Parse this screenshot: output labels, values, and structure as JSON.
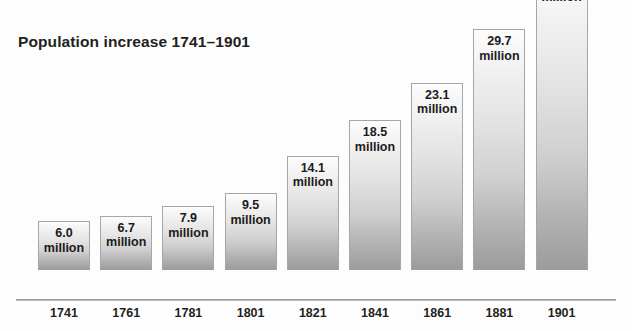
{
  "chart_data": {
    "type": "bar",
    "title": "Population increase 1741–1901",
    "xlabel": "",
    "ylabel": "",
    "unit_label": "million",
    "categories": [
      "1741",
      "1761",
      "1781",
      "1801",
      "1821",
      "1841",
      "1861",
      "1881",
      "1901"
    ],
    "values": [
      6.0,
      6.7,
      7.9,
      9.5,
      14.1,
      18.5,
      23.1,
      29.7,
      37.0
    ],
    "value_labels": [
      "6.0",
      "6.7",
      "7.9",
      "9.5",
      "14.1",
      "18.5",
      "23.1",
      "29.7",
      "37.0"
    ],
    "ylim": [
      0,
      37.0
    ],
    "grid": false,
    "legend": null,
    "bars": [
      {
        "year": "1741",
        "value": 6.0,
        "value_label": "6.0",
        "unit": "million"
      },
      {
        "year": "1761",
        "value": 6.7,
        "value_label": "6.7",
        "unit": "million"
      },
      {
        "year": "1781",
        "value": 7.9,
        "value_label": "7.9",
        "unit": "million"
      },
      {
        "year": "1801",
        "value": 9.5,
        "value_label": "9.5",
        "unit": "million"
      },
      {
        "year": "1821",
        "value": 14.1,
        "value_label": "14.1",
        "unit": "million"
      },
      {
        "year": "1841",
        "value": 18.5,
        "value_label": "18.5",
        "unit": "million"
      },
      {
        "year": "1861",
        "value": 23.1,
        "value_label": "23.1",
        "unit": "million"
      },
      {
        "year": "1881",
        "value": 29.7,
        "value_label": "29.7",
        "unit": "million"
      },
      {
        "year": "1901",
        "value": 37.0,
        "value_label": "37.0",
        "unit": "million"
      }
    ],
    "colors": {
      "bar_top": "#fcfcfc",
      "bar_bottom": "#9b9b9b",
      "bar_border": "#a6a6a6",
      "text": "#231f20",
      "axis": "#9c9c9c",
      "background": "#fdfdfd"
    }
  }
}
